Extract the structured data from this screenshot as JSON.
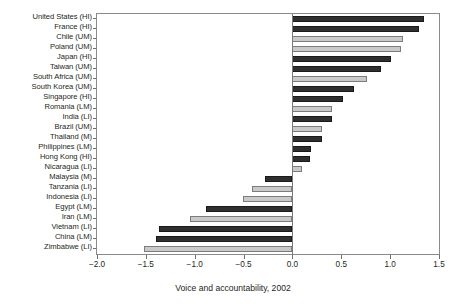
{
  "chart_data": {
    "type": "bar",
    "orientation": "horizontal",
    "title": "",
    "xlabel": "Voice and accountability, 2002",
    "ylabel": "",
    "xlim": [
      -2.0,
      1.5
    ],
    "xticks": [
      -2.0,
      -1.5,
      -1.0,
      -0.5,
      0.0,
      0.5,
      1.0,
      1.5
    ],
    "xticklabels": [
      "−2.0",
      "−1.5",
      "−1.0",
      "−0.5",
      "0.0",
      "0.5",
      "1.0",
      "1.5"
    ],
    "grid": false,
    "legend": "none",
    "colors": {
      "dark": "#2f2f2f",
      "light": "#c9c9c9",
      "frame": "#8a8a8a"
    },
    "categories": [
      "United States (HI)",
      "France (HI)",
      "Chile (UM)",
      "Poland (UM)",
      "Japan (HI)",
      "Taiwan (UM)",
      "South Africa (UM)",
      "South Korea (UM)",
      "Singapore (HI)",
      "Romania (LM)",
      "India (LI)",
      "Brazil (UM)",
      "Thailand (M)",
      "Philippines (LM)",
      "Hong Kong (HI)",
      "Nicaragua (LI)",
      "Malaysia (M)",
      "Tanzania (LI)",
      "Indonesia (LI)",
      "Egypt (LM)",
      "Iran (LM)",
      "Vietnam (LI)",
      "China (LM)",
      "Zimbabwe (LI)"
    ],
    "values": [
      1.35,
      1.3,
      1.13,
      1.11,
      1.01,
      0.91,
      0.76,
      0.63,
      0.52,
      0.4,
      0.41,
      0.3,
      0.3,
      0.19,
      0.18,
      0.1,
      -0.28,
      -0.41,
      -0.51,
      -0.88,
      -1.05,
      -1.37,
      -1.4,
      -1.52
    ],
    "bar_shades": [
      "dark",
      "dark",
      "light",
      "light",
      "dark",
      "dark",
      "light",
      "dark",
      "dark",
      "light",
      "dark",
      "light",
      "dark",
      "dark",
      "dark",
      "light",
      "dark",
      "light",
      "light",
      "dark",
      "light",
      "dark",
      "dark",
      "light"
    ]
  }
}
